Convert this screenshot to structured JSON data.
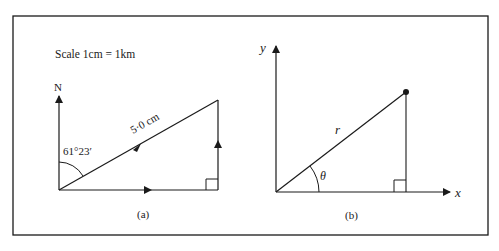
{
  "figure": {
    "panel_a": {
      "scale_text": "Scale 1cm = 1km",
      "north_label": "N",
      "angle_label": "61°23′",
      "hypotenuse_label": "5·0 cm",
      "caption": "(a)"
    },
    "panel_b": {
      "y_axis_label": "y",
      "x_axis_label": "x",
      "radius_label": "r",
      "angle_label": "θ",
      "caption": "(b)"
    },
    "colors": {
      "line": "#1a1a1a",
      "background": "#ffffff"
    }
  }
}
